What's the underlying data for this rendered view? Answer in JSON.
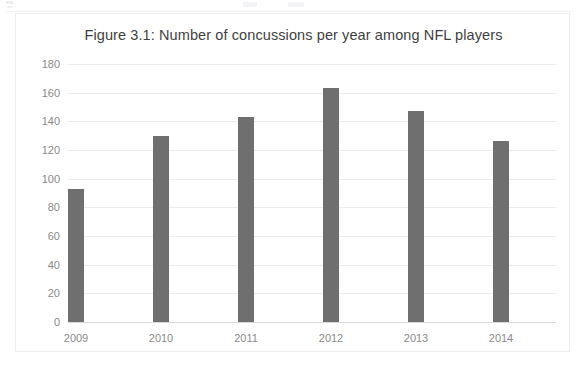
{
  "figure": {
    "frame_border_color": "#ececed",
    "background_color": "#ffffff"
  },
  "chart_data": {
    "type": "bar",
    "title": "Figure 3.1: Number of concussions per year among NFL players",
    "xlabel": "",
    "ylabel": "",
    "categories": [
      "2009",
      "2010",
      "2011",
      "2012",
      "2013",
      "2014"
    ],
    "values": [
      93,
      130,
      143,
      163,
      147,
      126
    ],
    "series": [
      {
        "name": "Concussions",
        "values": [
          93,
          130,
          143,
          163,
          147,
          126
        ],
        "color": "#6f6f6f"
      }
    ],
    "ylim": [
      0,
      180
    ],
    "ytick_labels": [
      "180",
      "160",
      "140",
      "120",
      "100",
      "80",
      "60",
      "40",
      "20",
      "0"
    ],
    "ytick_values": [
      180,
      160,
      140,
      120,
      100,
      80,
      60,
      40,
      20,
      0
    ],
    "ytick_step": 20,
    "grid": true,
    "grid_color": "#ebebeb",
    "grid_axis": "y",
    "legend": false,
    "legend_position": "none",
    "bar_color": "#6f6f6f",
    "axis_label_color": "#8a8a8a",
    "title_color": "#3f3f3f"
  }
}
